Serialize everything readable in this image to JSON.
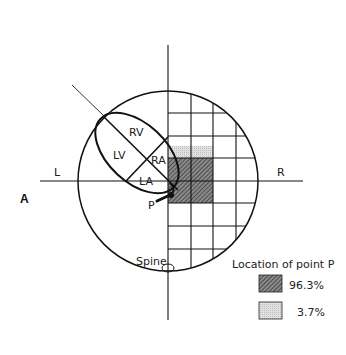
{
  "figure": {
    "panel_label": "A",
    "axis_labels": {
      "left": "L",
      "right": "R"
    },
    "chambers": {
      "rv": "RV",
      "lv": "LV",
      "ra": "RA",
      "la": "LA"
    },
    "point_label": "P",
    "spine_label": "Spine"
  },
  "legend": {
    "title": "Location of point P",
    "items": [
      {
        "label": "96.3%",
        "pattern": "dark-hatch",
        "color": "#6a6a6a"
      },
      {
        "label": "3.7%",
        "pattern": "light-dots",
        "color": "#d8d8d8"
      }
    ]
  }
}
